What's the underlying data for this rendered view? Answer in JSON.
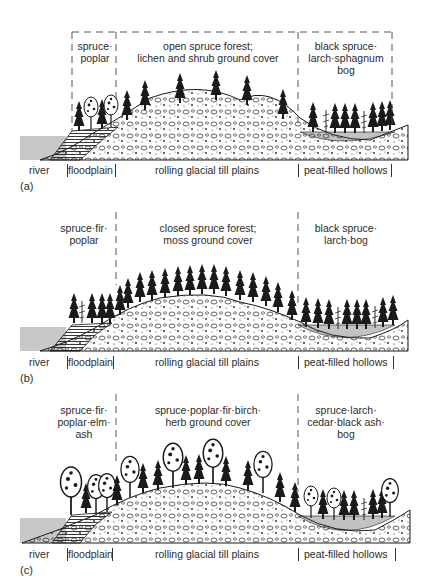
{
  "panels": [
    {
      "letter": "(a)",
      "zones": {
        "floodplain_veg": [
          "spruce·",
          "poplar"
        ],
        "upland_veg": [
          "open spruce forest;",
          "lichen and shrub ground cover"
        ],
        "bog_veg": [
          "black spruce·",
          "larch·sphagnum",
          "bog"
        ]
      },
      "divider_style": "boxed-dashed"
    },
    {
      "letter": "(b)",
      "zones": {
        "floodplain_veg": [
          "spruce·fir·",
          "poplar"
        ],
        "upland_veg": [
          "closed spruce forest;",
          "moss ground cover"
        ],
        "bog_veg": [
          "black spruce·",
          "larch·bog"
        ]
      },
      "divider_style": "vertical-dashed"
    },
    {
      "letter": "(c)",
      "zones": {
        "floodplain_veg": [
          "spruce·fir·",
          "poplar·elm·",
          "ash"
        ],
        "upland_veg": [
          "spruce·poplar·fir·birch·",
          "herb ground cover"
        ],
        "bog_veg": [
          "spruce·larch·",
          "cedar·black ash·",
          "bog"
        ]
      },
      "divider_style": "vertical-dashed"
    }
  ],
  "landforms": {
    "river": "river",
    "floodplain": "floodplain",
    "till": "rolling glacial till plains",
    "hollows": "peat-filled hollows"
  },
  "colors": {
    "ink": "#1e1e1e",
    "water": "#c8c8c8",
    "background": "#ffffff"
  }
}
